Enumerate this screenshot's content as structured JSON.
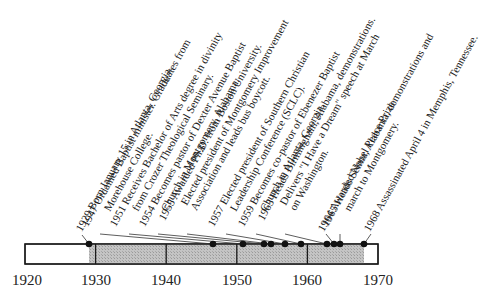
{
  "timeline": {
    "title": "Martin Luther King Jr. timeline",
    "start_year": 1920,
    "end_year": 1970,
    "axis_ticks": [
      "1920",
      "1930",
      "1940",
      "1950",
      "1960",
      "1970"
    ],
    "lifespan": {
      "from": 1929,
      "to": 1968
    },
    "colors": {
      "shaded": "#bdbdbd",
      "border": "#1a1a1a",
      "marker": "#111111"
    },
    "events": [
      {
        "year": "1929",
        "line1": "1929 Born January 15 in Atlanta, Georgia.",
        "line2": ""
      },
      {
        "year": "1947",
        "line1": "1947 Ordained Baptist minister. Graduates from",
        "line2": "Morehouse College."
      },
      {
        "year": "1951",
        "line1": "1951 Receives Bachelor of Arts degree in divinity",
        "line2": "from Crozer Theological Seminary."
      },
      {
        "year": "1954",
        "line1": "1954 Becomes pastor of Dexter Avenue Baptist",
        "line2": "Church in Montgomery, Alabama."
      },
      {
        "year": "1955",
        "line1": "1955 Awarded Ph.D. from Boston University.",
        "line2": "Elected president of Montgomery Improvement",
        "line3": "Association and leads bus boycott."
      },
      {
        "year": "1957",
        "line1": "1957 Elected president of Southern Christian",
        "line2": "Leadership Conference (SCLC)."
      },
      {
        "year": "1959",
        "line1": "1959 Becomes co-pastor of Ebenezer Baptist",
        "line2": "Church in Atlanta, Georgia."
      },
      {
        "year": "1963",
        "line1": "1963 Heads Birmingham, Alabama, demonstrations.",
        "line2": "Delivers \"I Have a Dream\" speech at March",
        "line3": "on Washington."
      },
      {
        "year": "1964",
        "line1": "1964 Awarded Nobel Peace Prize.",
        "line2": ""
      },
      {
        "year": "1965",
        "line1": "1965 Heads Selma, Alabama, demonstrations and",
        "line2": "march to Montgomery."
      },
      {
        "year": "1968",
        "line1": "1968 Assassinated April 4 in Memphis, Tennessee.",
        "line2": ""
      }
    ]
  }
}
